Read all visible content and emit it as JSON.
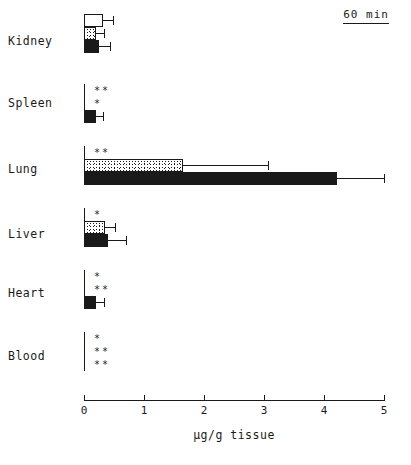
{
  "figure": {
    "timepoint_label": "60 min",
    "x_axis_title": "µg/g tissue",
    "x_ticks": [
      "0",
      "1",
      "2",
      "3",
      "4",
      "5"
    ],
    "axis_color": "#1a1a1a"
  },
  "chart_data": {
    "type": "bar",
    "orientation": "horizontal",
    "title": "60 min",
    "xlabel": "µg/g tissue",
    "ylabel": "",
    "xlim": [
      0,
      5
    ],
    "grid": false,
    "legend_position": "none",
    "categories": [
      "Kidney",
      "Spleen",
      "Lung",
      "Liver",
      "Heart",
      "Blood"
    ],
    "series": [
      {
        "name": "open",
        "fill": "open",
        "values": [
          0.32,
          0.0,
          0.0,
          0.03,
          0.0,
          0.0
        ],
        "errors": [
          0.17,
          0.0,
          0.0,
          0.0,
          0.0,
          0.0
        ],
        "significance": [
          "",
          "**",
          "**",
          "*",
          "*",
          "*"
        ]
      },
      {
        "name": "stippled",
        "fill": "stippled",
        "values": [
          0.2,
          0.0,
          1.65,
          0.35,
          0.0,
          0.0
        ],
        "errors": [
          0.14,
          0.0,
          1.42,
          0.17,
          0.0,
          0.0
        ],
        "significance": [
          "",
          "*",
          "",
          "",
          "**",
          "**"
        ]
      },
      {
        "name": "solid",
        "fill": "solid",
        "values": [
          0.25,
          0.2,
          4.22,
          0.4,
          0.2,
          0.0
        ],
        "errors": [
          0.19,
          0.12,
          0.78,
          0.3,
          0.13,
          0.0
        ],
        "significance": [
          "",
          "",
          "",
          "",
          "",
          "**"
        ]
      }
    ]
  },
  "categories": [
    {
      "label": "Kidney",
      "bars": [
        {
          "fill": "open",
          "value": 0.32,
          "error": 0.17,
          "sig": ""
        },
        {
          "fill": "stippled",
          "value": 0.2,
          "error": 0.14,
          "sig": ""
        },
        {
          "fill": "solid",
          "value": 0.25,
          "error": 0.19,
          "sig": ""
        }
      ]
    },
    {
      "label": "Spleen",
      "bars": [
        {
          "fill": "open",
          "value": 0.0,
          "error": 0.0,
          "sig": "**"
        },
        {
          "fill": "stippled",
          "value": 0.0,
          "error": 0.0,
          "sig": "*"
        },
        {
          "fill": "solid",
          "value": 0.2,
          "error": 0.12,
          "sig": ""
        }
      ]
    },
    {
      "label": "Lung",
      "bars": [
        {
          "fill": "open",
          "value": 0.0,
          "error": 0.0,
          "sig": "**"
        },
        {
          "fill": "stippled",
          "value": 1.65,
          "error": 1.42,
          "sig": ""
        },
        {
          "fill": "solid",
          "value": 4.22,
          "error": 0.78,
          "sig": ""
        }
      ]
    },
    {
      "label": "Liver",
      "bars": [
        {
          "fill": "open",
          "value": 0.03,
          "error": 0.0,
          "sig": "*"
        },
        {
          "fill": "stippled",
          "value": 0.35,
          "error": 0.17,
          "sig": ""
        },
        {
          "fill": "solid",
          "value": 0.4,
          "error": 0.3,
          "sig": ""
        }
      ]
    },
    {
      "label": "Heart",
      "bars": [
        {
          "fill": "open",
          "value": 0.0,
          "error": 0.0,
          "sig": "*"
        },
        {
          "fill": "stippled",
          "value": 0.0,
          "error": 0.0,
          "sig": "**"
        },
        {
          "fill": "solid",
          "value": 0.2,
          "error": 0.13,
          "sig": ""
        }
      ]
    },
    {
      "label": "Blood",
      "bars": [
        {
          "fill": "open",
          "value": 0.0,
          "error": 0.0,
          "sig": "*"
        },
        {
          "fill": "stippled",
          "value": 0.0,
          "error": 0.0,
          "sig": "**"
        },
        {
          "fill": "solid",
          "value": 0.0,
          "error": 0.0,
          "sig": "**"
        }
      ]
    }
  ]
}
